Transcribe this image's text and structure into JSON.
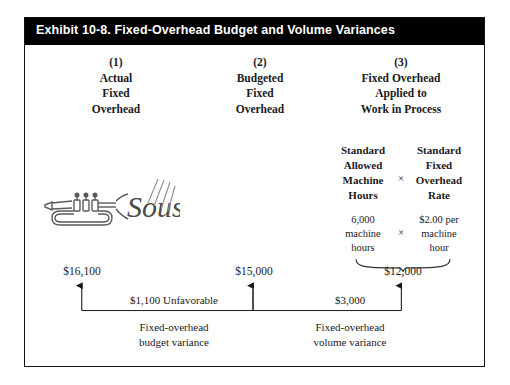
{
  "exhibit": {
    "title": "Exhibit 10-8. Fixed-Overhead Budget and Volume Variances",
    "border_color": "#111111",
    "title_bar_color": "#000000",
    "title_text_color": "#ffffff"
  },
  "columns": [
    {
      "number": "(1)",
      "lines": [
        "Actual",
        "Fixed",
        "Overhead"
      ],
      "amount": "$16,100"
    },
    {
      "number": "(2)",
      "lines": [
        "Budgeted",
        "Fixed",
        "Overhead"
      ],
      "amount": "$15,000"
    },
    {
      "number": "(3)",
      "lines": [
        "Fixed Overhead",
        "Applied to",
        "Work in Process"
      ],
      "amount": "$12,000",
      "sub_headers": {
        "left": [
          "Standard",
          "Allowed",
          "Machine",
          "Hours"
        ],
        "operator": "×",
        "right": [
          "Standard",
          "Fixed",
          "Overhead",
          "Rate"
        ]
      },
      "sub_values": {
        "left": [
          "6,000",
          "machine",
          "hours"
        ],
        "operator": "×",
        "right": [
          "$2.00 per",
          "machine",
          "hour"
        ]
      }
    }
  ],
  "variances": [
    {
      "amount": "$1,100 Unfavorable",
      "caption": [
        "Fixed-overhead",
        "budget variance"
      ]
    },
    {
      "amount": "$3,000",
      "caption": [
        "Fixed-overhead",
        "volume variance"
      ]
    }
  ],
  "illustration": {
    "name": "trumpet-sousa-logo",
    "word": "Sousa"
  }
}
